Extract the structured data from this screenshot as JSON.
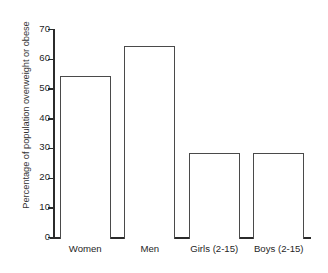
{
  "chart_data": {
    "type": "bar",
    "title": "",
    "subtitle": "",
    "xlabel": "",
    "ylabel": "Percentage of population overweight or obese",
    "categories": [
      "Women",
      "Men",
      "Girls (2-15)",
      "Boys (2-15)"
    ],
    "values": [
      55,
      65,
      29,
      29
    ],
    "series": [
      {
        "name": "Percentage overweight or obese",
        "values": [
          55,
          65,
          29,
          29
        ]
      }
    ],
    "ylim": [
      0,
      70
    ],
    "yticks": [
      0,
      10,
      20,
      30,
      40,
      50,
      60,
      70
    ],
    "ytick_labels": [
      "0",
      "10",
      "20",
      "30",
      "40",
      "50",
      "60",
      "70"
    ],
    "grid": false,
    "legend": false,
    "legend_position": "none",
    "bar_fill_color": "#ffffff",
    "bar_edge_color": "#4a4a4a",
    "axis_color": "#2b2b2b",
    "background_color": "#ffffff",
    "annotations": []
  }
}
